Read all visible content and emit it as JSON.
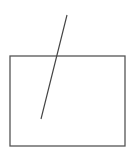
{
  "canvas": {
    "width": 137,
    "height": 159,
    "background": "#ffffff"
  },
  "shapes": {
    "rectangle": {
      "x": 10,
      "y": 56,
      "width": 115,
      "height": 90,
      "stroke": "#555555",
      "stroke_width": 1.3
    },
    "line": {
      "x1": 67,
      "y1": 15,
      "x2": 41,
      "y2": 119,
      "stroke": "#444444",
      "stroke_width": 1.2
    }
  }
}
